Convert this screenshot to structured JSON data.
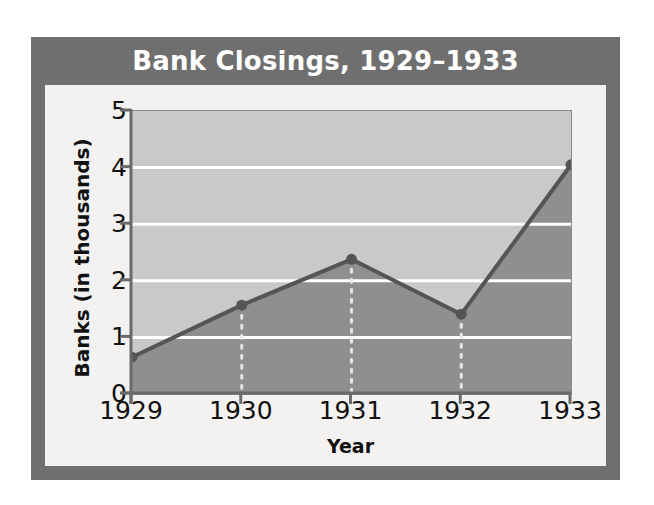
{
  "chart_data": {
    "type": "area",
    "title": "Bank Closings, 1929–1933",
    "xlabel": "Year",
    "ylabel": "Banks (in thousands)",
    "categories": [
      "1929",
      "1930",
      "1931",
      "1932",
      "1933"
    ],
    "values": [
      0.65,
      1.57,
      2.38,
      1.41,
      4.05
    ],
    "series": [
      {
        "name": "Bank closings",
        "values": [
          0.65,
          1.57,
          2.38,
          1.41,
          4.05
        ]
      }
    ],
    "x": [
      1929,
      1930,
      1931,
      1932,
      1933
    ],
    "ylim": [
      0,
      5
    ],
    "xlim": [
      1929,
      1933
    ],
    "ytick_labels": [
      "0",
      "1",
      "2",
      "3",
      "4",
      "5"
    ],
    "ytick_values": [
      0,
      1,
      2,
      3,
      4,
      5
    ],
    "xtick_labels": [
      "1929",
      "1930",
      "1931",
      "1932",
      "1933"
    ],
    "grid": "horizontal-white-gridlines",
    "legend": "none",
    "units": "thousands of banks",
    "annotations": [
      "dotted white drop lines at 1930, 1931 and 1932"
    ],
    "colors": {
      "frame": "#6f6f6f",
      "panel": "#f3f2f0",
      "plot_background_above_line": "#c9c9c9",
      "area_fill_below_line": "#8f8f8f",
      "line": "#555555",
      "marker": "#555555",
      "gridline": "#ffffff",
      "title_text": "#ffffff",
      "axis_text": "#111111"
    }
  }
}
